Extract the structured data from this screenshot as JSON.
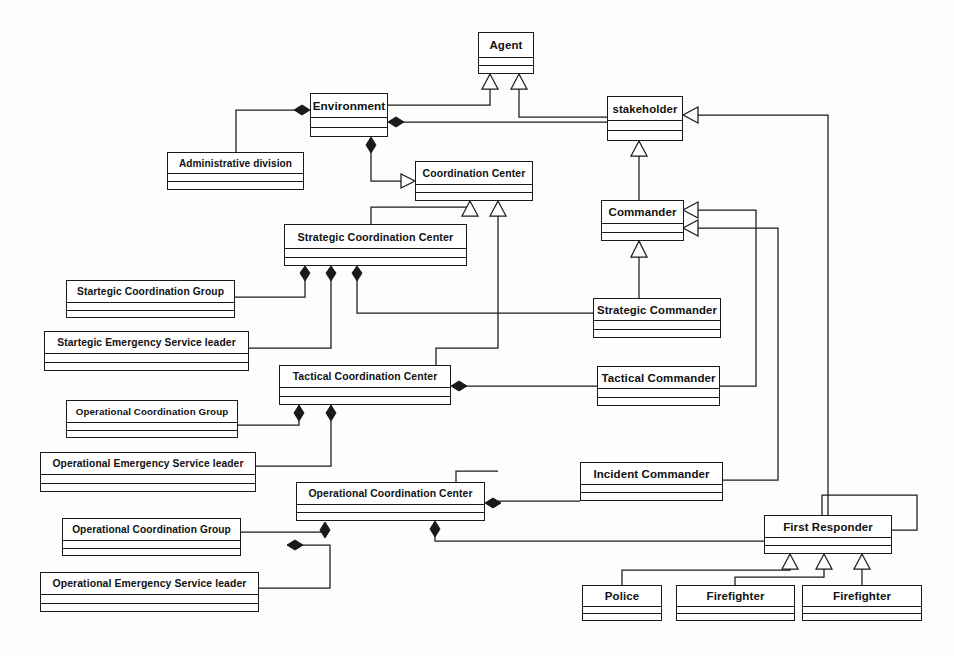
{
  "diagram": {
    "type": "uml-class-diagram",
    "width": 954,
    "height": 656,
    "line_color": "#1a1a1a",
    "fill_color": "#ffffff",
    "background_color": "#fdfdfc"
  },
  "classes": [
    {
      "id": "agent",
      "label": "Agent",
      "x": 478,
      "y": 32,
      "w": 56,
      "h": 42,
      "name_h": 24
    },
    {
      "id": "env",
      "label": "Environment",
      "x": 310,
      "y": 93,
      "w": 78,
      "h": 44,
      "name_h": 23
    },
    {
      "id": "stake",
      "label": "stakeholder",
      "x": 607,
      "y": 96,
      "w": 76,
      "h": 45,
      "name_h": 23
    },
    {
      "id": "admindiv",
      "label": "Administrative division",
      "x": 167,
      "y": 152,
      "w": 137,
      "h": 38,
      "name_h": 20
    },
    {
      "id": "cc",
      "label": "Coordination Center",
      "x": 415,
      "y": 161,
      "w": 118,
      "h": 40,
      "name_h": 22
    },
    {
      "id": "commander",
      "label": "Commander",
      "x": 601,
      "y": 200,
      "w": 83,
      "h": 41,
      "name_h": 22
    },
    {
      "id": "scc",
      "label": "Strategic Coordination Center",
      "x": 284,
      "y": 224,
      "w": 183,
      "h": 42,
      "name_h": 23
    },
    {
      "id": "scg",
      "label": "Startegic Coordination Group",
      "x": 66,
      "y": 280,
      "w": 169,
      "h": 38,
      "name_h": 21
    },
    {
      "id": "strcmd",
      "label": "Strategic Commander",
      "x": 593,
      "y": 298,
      "w": 128,
      "h": 40,
      "name_h": 21
    },
    {
      "id": "sesl",
      "label": "Startegic Emergency Service leader",
      "x": 44,
      "y": 331,
      "w": 205,
      "h": 40,
      "name_h": 21
    },
    {
      "id": "tcc",
      "label": "Tactical Coordination Center",
      "x": 279,
      "y": 365,
      "w": 172,
      "h": 40,
      "name_h": 21
    },
    {
      "id": "tacmd",
      "label": "Tactical Commander",
      "x": 597,
      "y": 366,
      "w": 123,
      "h": 40,
      "name_h": 21
    },
    {
      "id": "ocg1",
      "label": "Operational Coordination Group",
      "x": 66,
      "y": 400,
      "w": 172,
      "h": 38,
      "name_h": 21
    },
    {
      "id": "oesl1",
      "label": "Operational Emergency Service leader",
      "x": 40,
      "y": 452,
      "w": 216,
      "h": 40,
      "name_h": 21
    },
    {
      "id": "inccmd",
      "label": "Incident Commander",
      "x": 580,
      "y": 462,
      "w": 143,
      "h": 39,
      "name_h": 21
    },
    {
      "id": "occ",
      "label": "Operational Coordination Center",
      "x": 296,
      "y": 482,
      "w": 189,
      "h": 39,
      "name_h": 21
    },
    {
      "id": "fr",
      "label": "First Responder",
      "x": 764,
      "y": 515,
      "w": 128,
      "h": 39,
      "name_h": 21
    },
    {
      "id": "ocg2",
      "label": "Operational Coordination Group",
      "x": 62,
      "y": 518,
      "w": 179,
      "h": 38,
      "name_h": 21
    },
    {
      "id": "oesl2",
      "label": "Operational Emergency Service leader",
      "x": 40,
      "y": 572,
      "w": 219,
      "h": 40,
      "name_h": 21
    },
    {
      "id": "police",
      "label": "Police",
      "x": 582,
      "y": 585,
      "w": 80,
      "h": 36,
      "name_h": 20
    },
    {
      "id": "ff1",
      "label": "Firefighter",
      "x": 676,
      "y": 585,
      "w": 119,
      "h": 36,
      "name_h": 20
    },
    {
      "id": "ff2",
      "label": "Firefighter",
      "x": 802,
      "y": 585,
      "w": 120,
      "h": 36,
      "name_h": 20
    }
  ],
  "relationships": [
    {
      "from": "env",
      "to": "agent",
      "type": "generalization"
    },
    {
      "from": "stake",
      "to": "agent",
      "type": "generalization"
    },
    {
      "from": "admindiv",
      "to": "env",
      "type": "composition"
    },
    {
      "from": "stake",
      "to": "env",
      "type": "composition"
    },
    {
      "from": "cc",
      "to": "env",
      "type": "composition"
    },
    {
      "from": "scc",
      "to": "cc",
      "type": "generalization"
    },
    {
      "from": "tcc",
      "to": "cc",
      "type": "generalization"
    },
    {
      "from": "occ",
      "to": "cc",
      "type": "generalization"
    },
    {
      "from": "commander",
      "to": "stake",
      "type": "generalization"
    },
    {
      "from": "fr",
      "to": "stake",
      "type": "generalization"
    },
    {
      "from": "strcmd",
      "to": "commander",
      "type": "generalization"
    },
    {
      "from": "tacmd",
      "to": "commander",
      "type": "generalization"
    },
    {
      "from": "inccmd",
      "to": "commander",
      "type": "generalization"
    },
    {
      "from": "scg",
      "to": "scc",
      "type": "composition"
    },
    {
      "from": "sesl",
      "to": "scc",
      "type": "composition"
    },
    {
      "from": "strcmd",
      "to": "scc",
      "type": "composition"
    },
    {
      "from": "ocg1",
      "to": "tcc",
      "type": "composition"
    },
    {
      "from": "oesl1",
      "to": "tcc",
      "type": "composition"
    },
    {
      "from": "tacmd",
      "to": "tcc",
      "type": "composition"
    },
    {
      "from": "ocg2",
      "to": "occ",
      "type": "composition"
    },
    {
      "from": "oesl2",
      "to": "occ",
      "type": "composition"
    },
    {
      "from": "inccmd",
      "to": "occ",
      "type": "composition"
    },
    {
      "from": "fr",
      "to": "occ",
      "type": "composition"
    },
    {
      "from": "police",
      "to": "fr",
      "type": "generalization"
    },
    {
      "from": "ff1",
      "to": "fr",
      "type": "generalization"
    },
    {
      "from": "ff2",
      "to": "fr",
      "type": "generalization"
    }
  ]
}
